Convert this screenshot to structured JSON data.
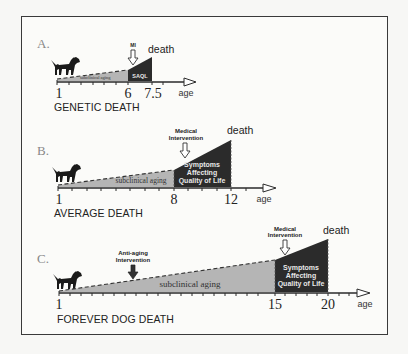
{
  "colors": {
    "subclinical_fill": "#b5b5b5",
    "symptomatic_fill": "#2b2b2b",
    "axis": "#2a2a2a",
    "dog": "#1a1a1a",
    "frame": "#3a3a3a"
  },
  "panels": [
    {
      "letter": "A.",
      "caption": "GENETIC DEATH",
      "death_label": "death",
      "axis_label": "age",
      "ticks": [
        {
          "label": "1",
          "age": 1
        },
        {
          "label": "6",
          "age": 6
        },
        {
          "label": "7.5",
          "age": 7.5
        }
      ],
      "subclinical_label": "subclinical aging",
      "symptom_label": [
        "SAQL"
      ],
      "intervention": {
        "label": [
          "MI"
        ],
        "type": "hollow-down-arrow",
        "age": 6
      }
    },
    {
      "letter": "B.",
      "caption": "AVERAGE DEATH",
      "death_label": "death",
      "axis_label": "age",
      "ticks": [
        {
          "label": "1",
          "age": 1
        },
        {
          "label": "8",
          "age": 8
        },
        {
          "label": "12",
          "age": 12
        }
      ],
      "subclinical_label": "subclinical aging",
      "symptom_label": [
        "Symptoms",
        "Affecting",
        "Quality of Life"
      ],
      "intervention": {
        "label": [
          "Medical",
          "Intervention"
        ],
        "type": "hollow-down-arrow",
        "age": 8.8
      }
    },
    {
      "letter": "C.",
      "caption": "FOREVER DOG DEATH",
      "death_label": "death",
      "axis_label": "age",
      "ticks": [
        {
          "label": "1",
          "age": 1
        },
        {
          "label": "15",
          "age": 15
        },
        {
          "label": "20",
          "age": 20
        }
      ],
      "subclinical_label": "subclinical aging",
      "symptom_label": [
        "Symptoms",
        "Affecting",
        "Quality of Life"
      ],
      "intervention": {
        "label": [
          "Medical",
          "Intervention"
        ],
        "type": "hollow-down-arrow",
        "age": 15.8
      },
      "anti_aging": {
        "label": [
          "Anti-aging",
          "Intervention"
        ],
        "type": "filled-down-arrow",
        "age": 5
      }
    }
  ]
}
